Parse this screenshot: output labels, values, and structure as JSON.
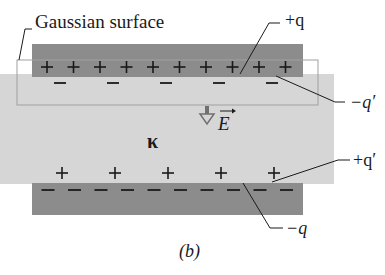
{
  "figure": {
    "caption": "(b)",
    "colors": {
      "plate": "#8c8c8c",
      "dielectric": "#d6d6d6",
      "surface_outline": "#9a9a9a",
      "ink": "#1a1a1a"
    }
  },
  "labels": {
    "gaussian_surface": "Gaussian surface",
    "plus_q": "+q",
    "minus_q_prime": "−q′",
    "plus_q_prime": "+q′",
    "minus_q": "−q",
    "field": "E",
    "dielectric_constant": "κ"
  },
  "top_plate": {
    "charge_symbol": "+",
    "charge_count": 10
  },
  "top_induced": {
    "charge_symbol": "−",
    "charge_count": 5
  },
  "bottom_induced": {
    "charge_symbol": "+",
    "charge_count": 5
  },
  "bottom_plate": {
    "charge_symbol": "−",
    "charge_count": 10
  }
}
